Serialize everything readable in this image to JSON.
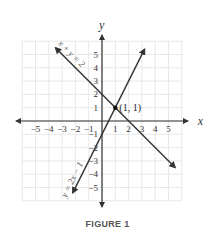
{
  "caption": "FIGURE 1",
  "chart_data": {
    "type": "line",
    "title": "",
    "xlabel": "x",
    "ylabel": "y",
    "xlim": [
      -6,
      6
    ],
    "ylim": [
      -6,
      6
    ],
    "grid": true,
    "x_ticks": [
      -5,
      -4,
      -3,
      -2,
      -1,
      1,
      2,
      3,
      4,
      5
    ],
    "y_ticks": [
      -5,
      -4,
      -3,
      -2,
      -1,
      1,
      2,
      3,
      4,
      5
    ],
    "series": [
      {
        "name": "x + y = 2",
        "label": "x + y = 2",
        "equation": {
          "slope": -1,
          "intercept": 2
        },
        "x_range": [
          -3.5,
          5.5
        ],
        "arrows": "both"
      },
      {
        "name": "y = 2x - 1",
        "label": "y = 2x − 1",
        "equation": {
          "slope": 2,
          "intercept": -1
        },
        "x_range": [
          -2.2,
          3.2
        ],
        "arrows": "both"
      }
    ],
    "points": [
      {
        "x": 1,
        "y": 1,
        "label": "(1, 1)"
      }
    ]
  }
}
